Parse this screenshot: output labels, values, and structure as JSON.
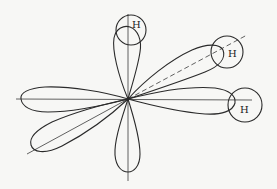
{
  "diagram": {
    "center": [
      128,
      99
    ],
    "labels": {
      "h_top": "H",
      "h_upper_right": "H",
      "h_right": "H"
    },
    "colors": {
      "stroke": "#2a2a2a",
      "background": "#f7f7f5"
    }
  }
}
